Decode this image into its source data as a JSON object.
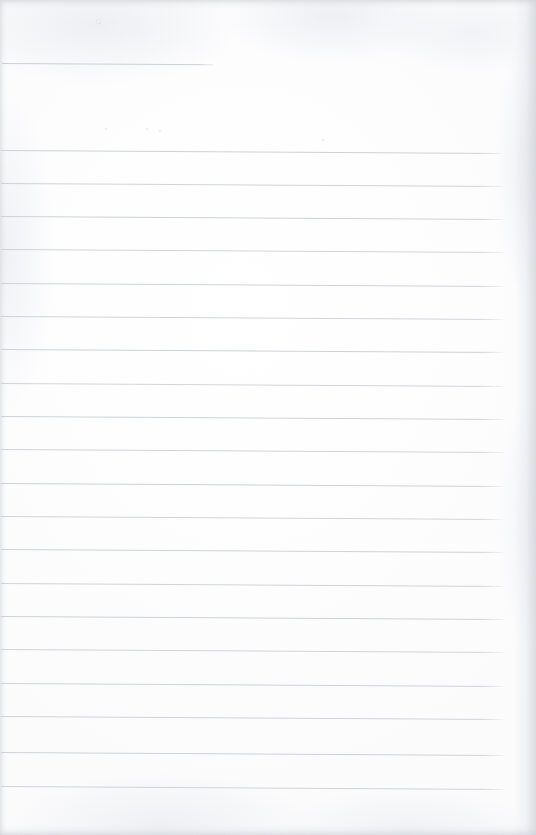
{
  "document": {
    "kind": "scanned-blank-ruled-page",
    "title": "Blank Lined Notebook Page",
    "text_content": "",
    "page_width": 536,
    "page_height": 835,
    "paper_color": "#fefefe",
    "rule_color": "#c9ced5",
    "edge_shadow_color": "#cdd1d7",
    "body_text": ""
  },
  "rules": {
    "count": 21,
    "left_x": 2,
    "right_x": 505,
    "spacing": 33.4,
    "slope_px": 3,
    "items": [
      {
        "id": "rule-header",
        "y": 63,
        "x": 2,
        "width": 211,
        "opacity": 0.95,
        "label": "header-rule"
      },
      {
        "id": "rule-1",
        "y": 150,
        "x": 1,
        "width": 502,
        "opacity": 0.92,
        "label": "body-rule-1"
      },
      {
        "id": "rule-2",
        "y": 183,
        "x": 1,
        "width": 503,
        "opacity": 0.88,
        "label": "body-rule-2"
      },
      {
        "id": "rule-3",
        "y": 216,
        "x": 1,
        "width": 503,
        "opacity": 0.92,
        "label": "body-rule-3"
      },
      {
        "id": "rule-4",
        "y": 249,
        "x": 1,
        "width": 503,
        "opacity": 0.85,
        "label": "body-rule-4"
      },
      {
        "id": "rule-5",
        "y": 283,
        "x": 1,
        "width": 503,
        "opacity": 0.9,
        "label": "body-rule-5"
      },
      {
        "id": "rule-6",
        "y": 316,
        "x": 1,
        "width": 503,
        "opacity": 0.88,
        "label": "body-rule-6"
      },
      {
        "id": "rule-7",
        "y": 349,
        "x": 1,
        "width": 503,
        "opacity": 0.92,
        "label": "body-rule-7"
      },
      {
        "id": "rule-8",
        "y": 383,
        "x": 1,
        "width": 503,
        "opacity": 0.86,
        "label": "body-rule-8"
      },
      {
        "id": "rule-9",
        "y": 416,
        "x": 1,
        "width": 503,
        "opacity": 0.9,
        "label": "body-rule-9"
      },
      {
        "id": "rule-10",
        "y": 449,
        "x": 1,
        "width": 503,
        "opacity": 0.88,
        "label": "body-rule-10"
      },
      {
        "id": "rule-11",
        "y": 483,
        "x": 1,
        "width": 503,
        "opacity": 0.92,
        "label": "body-rule-11"
      },
      {
        "id": "rule-12",
        "y": 516,
        "x": 1,
        "width": 503,
        "opacity": 0.86,
        "label": "body-rule-12"
      },
      {
        "id": "rule-13",
        "y": 549,
        "x": 1,
        "width": 503,
        "opacity": 0.9,
        "label": "body-rule-13"
      },
      {
        "id": "rule-14",
        "y": 583,
        "x": 1,
        "width": 503,
        "opacity": 0.88,
        "label": "body-rule-14"
      },
      {
        "id": "rule-15",
        "y": 616,
        "x": 1,
        "width": 503,
        "opacity": 0.92,
        "label": "body-rule-15"
      },
      {
        "id": "rule-16",
        "y": 649,
        "x": 1,
        "width": 503,
        "opacity": 0.86,
        "label": "body-rule-16"
      },
      {
        "id": "rule-17",
        "y": 683,
        "x": 1,
        "width": 503,
        "opacity": 0.9,
        "label": "body-rule-17"
      },
      {
        "id": "rule-18",
        "y": 716,
        "x": 1,
        "width": 503,
        "opacity": 0.88,
        "label": "body-rule-18"
      },
      {
        "id": "rule-19",
        "y": 752,
        "x": 1,
        "width": 503,
        "opacity": 0.92,
        "label": "body-rule-19"
      },
      {
        "id": "rule-20",
        "y": 786,
        "x": 1,
        "width": 504,
        "opacity": 0.88,
        "label": "body-rule-20"
      }
    ]
  },
  "specks": [
    {
      "id": "speck-1",
      "x": 96,
      "y": 19,
      "size": 3,
      "shape": "box"
    },
    {
      "id": "speck-2",
      "x": 99,
      "y": 22,
      "size": 2,
      "shape": "dot"
    },
    {
      "id": "speck-3",
      "x": 105,
      "y": 128,
      "size": 2,
      "shape": "dot"
    },
    {
      "id": "speck-4",
      "x": 146,
      "y": 128,
      "size": 2,
      "shape": "dot"
    },
    {
      "id": "speck-5",
      "x": 159,
      "y": 130,
      "size": 2,
      "shape": "dot"
    },
    {
      "id": "speck-6",
      "x": 322,
      "y": 139,
      "size": 2,
      "shape": "dot"
    }
  ]
}
